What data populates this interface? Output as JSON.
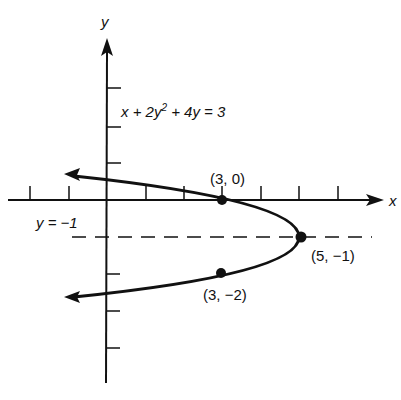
{
  "diagram": {
    "type": "parabola-graph",
    "equation": "x + 2y² + 4y = 3",
    "equation_parts": {
      "a": "x + 2y",
      "sup": "2",
      "b": " + 4y = 3"
    },
    "axis_labels": {
      "x": "x",
      "y": "y"
    },
    "axis_of_symmetry_label": "y = −1",
    "points": [
      {
        "label": "(3, 0)",
        "x": 3,
        "y": 0
      },
      {
        "label": "(5, −1)",
        "x": 5,
        "y": -1
      },
      {
        "label": "(3, −2)",
        "x": 3,
        "y": -2
      }
    ],
    "x_ticks": [
      -2,
      -1,
      1,
      2,
      3,
      4,
      5,
      6
    ],
    "y_ticks": [
      -4,
      -3,
      -2,
      1,
      2,
      3
    ],
    "colors": {
      "ink": "#111111",
      "background": "#ffffff"
    }
  }
}
